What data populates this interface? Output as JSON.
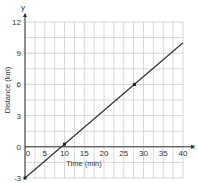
{
  "chart_data": {
    "type": "line",
    "title": "",
    "xlabel": "Time (min)",
    "ylabel": "Distance (km)",
    "x_axis_name": "x",
    "y_axis_name": "y",
    "xlim": [
      0,
      40
    ],
    "ylim": [
      -3,
      12
    ],
    "x_ticks": [
      0,
      5,
      10,
      15,
      20,
      25,
      30,
      35,
      40
    ],
    "y_ticks": [
      -3,
      0,
      3,
      6,
      9,
      12
    ],
    "grid": true,
    "grid_minor_x_step": 2.5,
    "grid_minor_y_step": 1.5,
    "series": [
      {
        "name": "line",
        "x": [
          0,
          40
        ],
        "y": [
          -3,
          10
        ],
        "color": "#333333"
      }
    ],
    "marked_points": [
      {
        "x": 0,
        "y": -3
      },
      {
        "x": 10,
        "y": 0.25
      },
      {
        "x": 27.7,
        "y": 6
      }
    ]
  }
}
